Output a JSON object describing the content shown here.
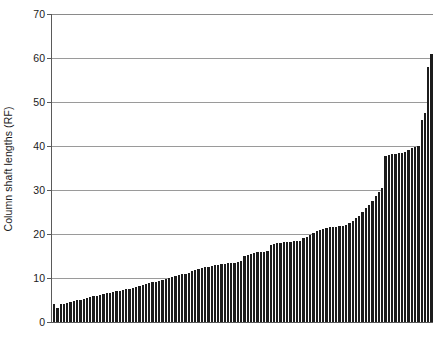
{
  "chart_data": {
    "type": "bar",
    "title": "",
    "subtitle": "",
    "xlabel": "",
    "ylabel": "Column shaft lengths (RF)",
    "ylim": [
      0,
      70
    ],
    "yticks": [
      0,
      10,
      20,
      30,
      40,
      50,
      60,
      70
    ],
    "ytick_labels": [
      "0",
      "10",
      "20",
      "30",
      "40",
      "50",
      "60",
      "70"
    ],
    "grid": "horizontal",
    "legend": "none",
    "bar_color": "#1c1c1c",
    "categories_note": "unlabeled individual columns, sorted ascending",
    "n_bars": 115,
    "values": [
      4.0,
      3.2,
      4.0,
      4.2,
      4.4,
      4.6,
      4.8,
      5.0,
      5.1,
      5.3,
      5.5,
      5.7,
      5.8,
      6.0,
      6.1,
      6.3,
      6.5,
      6.6,
      6.8,
      7.0,
      7.1,
      7.3,
      7.4,
      7.6,
      7.8,
      8.0,
      8.2,
      8.4,
      8.6,
      8.8,
      9.0,
      9.2,
      9.4,
      9.6,
      9.8,
      10.0,
      10.2,
      10.4,
      10.6,
      10.8,
      11.0,
      11.2,
      11.5,
      11.8,
      12.0,
      12.2,
      12.4,
      12.6,
      12.8,
      13.0,
      13.0,
      13.1,
      13.2,
      13.3,
      13.4,
      13.5,
      13.6,
      13.8,
      15.0,
      15.2,
      15.4,
      15.6,
      15.8,
      16.0,
      16.0,
      16.1,
      17.6,
      17.8,
      18.0,
      18.0,
      18.1,
      18.2,
      18.2,
      18.3,
      18.4,
      18.5,
      19.0,
      19.4,
      19.8,
      20.2,
      20.6,
      21.0,
      21.2,
      21.4,
      21.5,
      21.6,
      21.7,
      21.8,
      21.9,
      22.0,
      22.4,
      23.0,
      23.6,
      24.2,
      25.0,
      25.8,
      26.6,
      27.6,
      28.6,
      29.6,
      30.4,
      37.8,
      38.0,
      38.1,
      38.2,
      38.3,
      38.4,
      38.6,
      39.2,
      39.6,
      39.8,
      40.0,
      46.0,
      47.5,
      58.0,
      61.0
    ]
  }
}
